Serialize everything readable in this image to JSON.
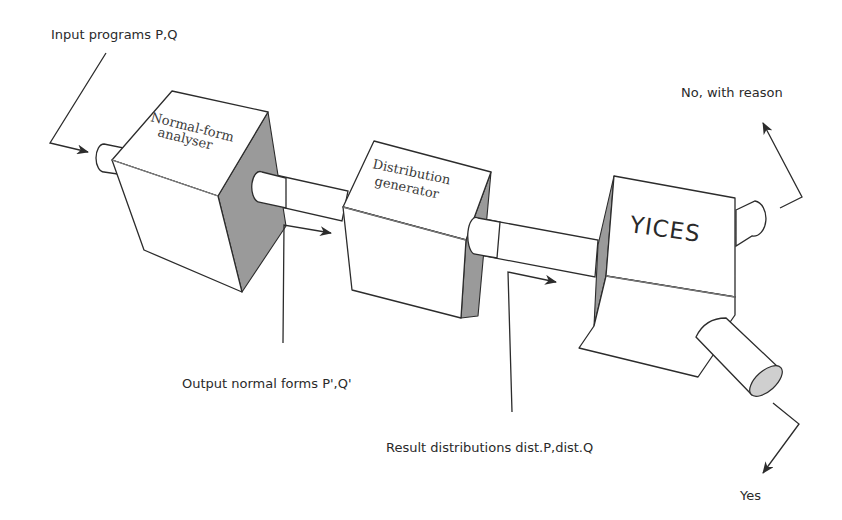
{
  "diagram": {
    "title": "",
    "components": [
      {
        "id": "normal-form-analyser",
        "label_line1": "Normal-form",
        "label_line2": "analyser"
      },
      {
        "id": "distribution-generator",
        "label_line1": "Distribution",
        "label_line2": "generator"
      },
      {
        "id": "yices",
        "label": "YICES"
      }
    ],
    "annotations": {
      "input": "Input programs P,Q",
      "output_normal_forms": "Output normal forms P',Q'",
      "result_distributions": "Result distributions dist.P,dist.Q",
      "no_branch": "No, with reason",
      "yes_branch": "Yes"
    },
    "flow": [
      {
        "from": "input",
        "to": "normal-form-analyser",
        "label": "Input programs P,Q"
      },
      {
        "from": "normal-form-analyser",
        "to": "distribution-generator",
        "label": "Output normal forms P',Q'"
      },
      {
        "from": "distribution-generator",
        "to": "yices",
        "label": "Result distributions dist.P,dist.Q"
      },
      {
        "from": "yices",
        "to": "no",
        "label": "No, with reason"
      },
      {
        "from": "yices",
        "to": "yes",
        "label": "Yes"
      }
    ],
    "colors": {
      "stroke": "#2c2c2c",
      "shade": "#9a9a9a",
      "face": "#ffffff",
      "text": "#2a2a2a"
    }
  }
}
